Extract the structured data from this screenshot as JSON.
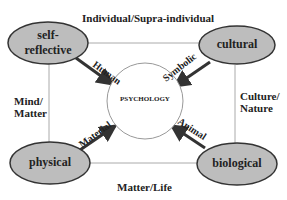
{
  "diagram": {
    "center": {
      "label": "PSYCHOLOGY"
    },
    "nodes": {
      "top_left": {
        "line1": "self-",
        "line2": "reflective"
      },
      "top_right": {
        "label": "cultural"
      },
      "bottom_left": {
        "label": "physical"
      },
      "bottom_right": {
        "label": "biological"
      }
    },
    "arrows": {
      "top_left": "Human",
      "top_right": "Symbolic",
      "bottom_left": "Material",
      "bottom_right": "Animal"
    },
    "axes": {
      "top": "Individual/Supra-individual",
      "left_line1": "Mind/",
      "left_line2": "Matter",
      "right_line1": "Culture/",
      "right_line2": "Nature",
      "bottom": "Matter/Life"
    },
    "colors": {
      "node_fill": "#bdbdbd",
      "node_stroke": "#333333",
      "line": "#999999",
      "arrow": "#333333"
    }
  }
}
